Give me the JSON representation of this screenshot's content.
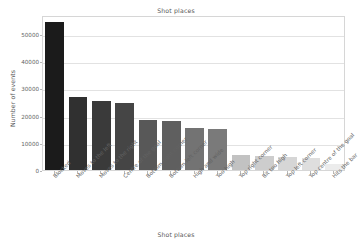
{
  "chart_data": {
    "type": "bar",
    "title": "Shot places",
    "xlabel": "Shot places",
    "ylabel": "Number of events",
    "categories": [
      "Blocked",
      "Moves to the left",
      "Moves to the right",
      "Centre of the goal",
      "Bottom right corner",
      "Bottom left corner",
      "High and wide",
      "Too high",
      "Top right corner",
      "Bit too high",
      "Top left corner",
      "Top centre of the goal",
      "Hits the bar"
    ],
    "values": [
      54300,
      27000,
      25200,
      24800,
      18400,
      17900,
      15400,
      15200,
      5700,
      5300,
      4900,
      4500,
      2200
    ],
    "colors": [
      "#1b1b1b",
      "#303030",
      "#3a3a3a",
      "#454545",
      "#585858",
      "#5f5f5f",
      "#737373",
      "#7a7a7a",
      "#c2c2c2",
      "#cdcdcd",
      "#d6d6d6",
      "#dedede",
      "#ececec"
    ],
    "ylim": [
      0,
      57000
    ],
    "yticks": [
      0,
      10000,
      20000,
      30000,
      40000,
      50000
    ],
    "ytick_labels": [
      "0",
      "10000",
      "20000",
      "30000",
      "40000",
      "50000"
    ],
    "grid": true,
    "legend": "none",
    "background": "#ffffff",
    "axis_color": "#d6d6d6",
    "text_color": "#5a5a5a"
  }
}
